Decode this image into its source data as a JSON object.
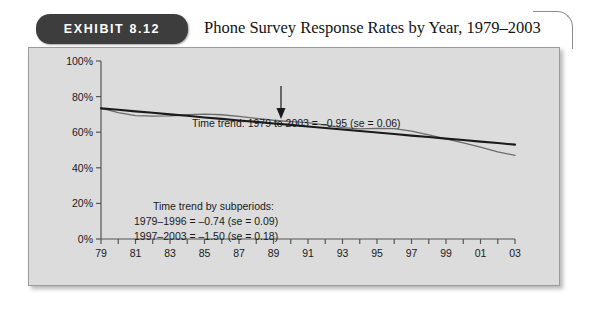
{
  "exhibit": {
    "badge_label": "EXHIBIT 8.12",
    "title": "Phone Survey Response Rates by Year, 1979–2003"
  },
  "chart_data": {
    "type": "line",
    "title": "Phone Survey Response Rates by Year, 1979–2003",
    "xlabel": "Year of Survey",
    "ylabel": "",
    "xlim": [
      1979,
      2003
    ],
    "ylim": [
      0,
      100
    ],
    "grid": false,
    "legend": "none",
    "y_ticks": [
      0,
      20,
      40,
      60,
      80,
      100
    ],
    "y_tick_labels": [
      "0%",
      "20%",
      "40%",
      "60%",
      "80%",
      "100%"
    ],
    "x_ticks": [
      1979,
      1980,
      1981,
      1982,
      1983,
      1984,
      1985,
      1986,
      1987,
      1988,
      1989,
      1990,
      1991,
      1992,
      1993,
      1994,
      1995,
      1996,
      1997,
      1998,
      1999,
      2000,
      2001,
      2002,
      2003
    ],
    "x_tick_labels": [
      "79",
      "",
      "81",
      "",
      "83",
      "",
      "85",
      "",
      "87",
      "",
      "89",
      "",
      "91",
      "",
      "93",
      "",
      "95",
      "",
      "97",
      "",
      "99",
      "",
      "01",
      "",
      "03"
    ],
    "x": [
      1979,
      1980,
      1981,
      1982,
      1983,
      1984,
      1985,
      1986,
      1987,
      1988,
      1989,
      1990,
      1991,
      1992,
      1993,
      1994,
      1995,
      1996,
      1997,
      1998,
      1999,
      2000,
      2001,
      2002,
      2003
    ],
    "series": [
      {
        "name": "Observed response rate",
        "style": "thin-wiggly",
        "color": "#6b6b6b",
        "values": [
          73.5,
          71.0,
          69.3,
          69.0,
          69.2,
          69.8,
          70.2,
          69.8,
          68.9,
          67.8,
          66.7,
          65.9,
          65.4,
          64.0,
          62.6,
          61.9,
          62.2,
          62.0,
          60.6,
          58.5,
          56.3,
          54.0,
          51.6,
          49.0,
          47.0
        ]
      },
      {
        "name": "Fitted time trend",
        "style": "thick-straight",
        "color": "#1a1a1a",
        "values": [
          73.4,
          72.6,
          71.7,
          70.9,
          70.0,
          69.2,
          68.3,
          67.5,
          66.6,
          65.8,
          64.9,
          64.1,
          63.2,
          62.4,
          61.5,
          60.7,
          59.8,
          59.0,
          58.1,
          57.3,
          56.4,
          55.6,
          54.7,
          53.9,
          53.0
        ],
        "note": "slope ≈ −0.95 percentage points per year"
      }
    ],
    "annotations": [
      {
        "id": "overall-trend",
        "text": "Time trend: 1979 to 2003 = –0.95 (se = 0.06)",
        "arrow": "down"
      },
      {
        "id": "subperiods-title",
        "text": "Time trend by subperiods:"
      },
      {
        "id": "subperiod-1",
        "text": "1979–1996 = –0.74 (se = 0.09)"
      },
      {
        "id": "subperiod-2",
        "text": "1997–2003 = –1.50 (se = 0.18)"
      }
    ]
  },
  "colors": {
    "panel_background": "#dcdcdc",
    "badge_background": "#3d3d3d",
    "axis": "#555555",
    "trend_line": "#1a1a1a",
    "data_line": "#6b6b6b"
  }
}
